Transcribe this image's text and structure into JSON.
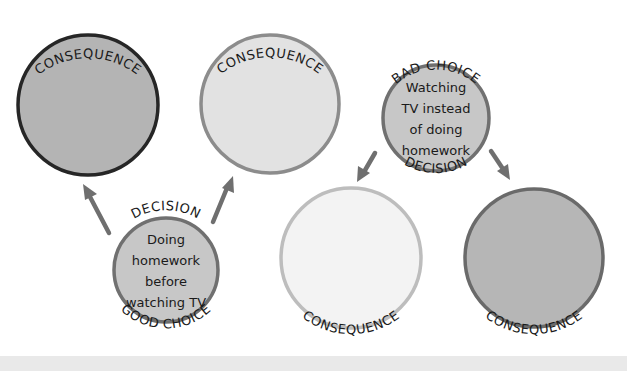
{
  "diagram": {
    "colors": {
      "dark_border": "#262626",
      "mid_border": "#707070",
      "gray_border": "#8c8c8c",
      "light_border": "#bdbdbd",
      "dark_fill": "#b4b4b4",
      "mid_fill": "#bdbdbd",
      "light_fill": "#e2e2e2",
      "lightest_fill": "#f2f2f2",
      "arrow": "#6f6f6f",
      "text": "#1a1a1a"
    },
    "nodes": {
      "consequence_top_left": {
        "label": "CONSEQUENCE"
      },
      "consequence_top_middle": {
        "label": "CONSEQUENCE"
      },
      "bad_choice": {
        "top_label": "BAD CHOICE",
        "bottom_label": "DECISION",
        "text_lines": [
          "Watching",
          "TV instead",
          "of doing",
          "homework"
        ]
      },
      "good_choice": {
        "top_label": "DECISION",
        "bottom_label": "GOOD CHOICE",
        "text_lines": [
          "Doing",
          "homework",
          "before",
          "watching TV"
        ]
      },
      "consequence_bottom_middle": {
        "label": "CONSEQUENCE"
      },
      "consequence_bottom_right": {
        "label": "CONSEQUENCE"
      }
    },
    "edges": [
      {
        "from": "good_choice",
        "to": "consequence_top_left"
      },
      {
        "from": "good_choice",
        "to": "consequence_top_middle"
      },
      {
        "from": "bad_choice",
        "to": "consequence_bottom_middle"
      },
      {
        "from": "bad_choice",
        "to": "consequence_bottom_right"
      }
    ]
  }
}
